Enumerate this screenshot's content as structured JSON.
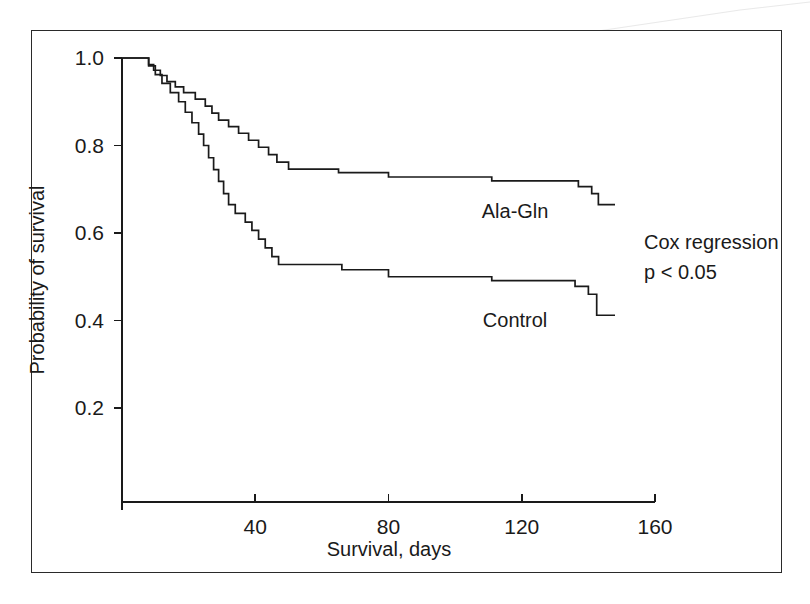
{
  "figure": {
    "border_color": "#2a2a2a",
    "background": "#ffffff",
    "line_color": "#1a1a1a"
  },
  "annotations": {
    "cox_line1": "Cox regression",
    "cox_line2": "p < 0.05"
  },
  "chart_data": {
    "type": "line",
    "subtype": "kaplan-meier-step",
    "title": "",
    "xlabel": "Survival, days",
    "ylabel": "Probability of survival",
    "xlim": [
      0,
      160
    ],
    "ylim": [
      0.0,
      1.0
    ],
    "xticks": [
      40,
      80,
      120,
      160
    ],
    "xtick_labels": [
      "40",
      "80",
      "120",
      "160"
    ],
    "yticks": [
      0.2,
      0.4,
      0.6,
      0.8,
      1.0
    ],
    "ytick_labels": [
      "0.2",
      "0.4",
      "0.6",
      "0.8",
      "1.0"
    ],
    "grid": false,
    "legend_position": "inline-annotation",
    "series": [
      {
        "name": "Ala-Gln",
        "label": "Ala-Gln",
        "label_x": 118,
        "label_y": 0.635,
        "color": "#1a1a1a",
        "points": [
          [
            0,
            1.0
          ],
          [
            8.0,
            1.0
          ],
          [
            8.0,
            0.985
          ],
          [
            9.5,
            0.985
          ],
          [
            9.5,
            0.972
          ],
          [
            11.5,
            0.972
          ],
          [
            11.5,
            0.96
          ],
          [
            13.5,
            0.96
          ],
          [
            13.5,
            0.946
          ],
          [
            16.0,
            0.946
          ],
          [
            16.0,
            0.934
          ],
          [
            18.5,
            0.934
          ],
          [
            18.5,
            0.921
          ],
          [
            22.0,
            0.921
          ],
          [
            22.0,
            0.906
          ],
          [
            25.0,
            0.906
          ],
          [
            25.0,
            0.89
          ],
          [
            27.0,
            0.89
          ],
          [
            27.0,
            0.874
          ],
          [
            29.0,
            0.874
          ],
          [
            29.0,
            0.858
          ],
          [
            32.0,
            0.858
          ],
          [
            32.0,
            0.843
          ],
          [
            35.0,
            0.843
          ],
          [
            35.0,
            0.828
          ],
          [
            38.0,
            0.828
          ],
          [
            38.0,
            0.812
          ],
          [
            41.0,
            0.812
          ],
          [
            41.0,
            0.796
          ],
          [
            44.0,
            0.796
          ],
          [
            44.0,
            0.779
          ],
          [
            46.5,
            0.779
          ],
          [
            46.5,
            0.762
          ],
          [
            50.0,
            0.762
          ],
          [
            50.0,
            0.746
          ],
          [
            65.0,
            0.746
          ],
          [
            65.0,
            0.738
          ],
          [
            80.0,
            0.738
          ],
          [
            80.0,
            0.728
          ],
          [
            111.0,
            0.728
          ],
          [
            111.0,
            0.719
          ],
          [
            137.0,
            0.719
          ],
          [
            137.0,
            0.706
          ],
          [
            141.0,
            0.706
          ],
          [
            141.0,
            0.69
          ],
          [
            143.0,
            0.69
          ],
          [
            143.0,
            0.665
          ],
          [
            148.0,
            0.665
          ]
        ]
      },
      {
        "name": "Control",
        "label": "Control",
        "label_x": 118,
        "label_y": 0.385,
        "color": "#1a1a1a",
        "points": [
          [
            0,
            1.0
          ],
          [
            8.0,
            1.0
          ],
          [
            8.0,
            0.982
          ],
          [
            10.0,
            0.982
          ],
          [
            10.0,
            0.962
          ],
          [
            12.0,
            0.962
          ],
          [
            12.0,
            0.942
          ],
          [
            14.5,
            0.942
          ],
          [
            14.5,
            0.921
          ],
          [
            17.0,
            0.921
          ],
          [
            17.0,
            0.9
          ],
          [
            19.0,
            0.9
          ],
          [
            19.0,
            0.876
          ],
          [
            21.0,
            0.876
          ],
          [
            21.0,
            0.852
          ],
          [
            23.0,
            0.852
          ],
          [
            23.0,
            0.826
          ],
          [
            24.5,
            0.826
          ],
          [
            24.5,
            0.8
          ],
          [
            26.0,
            0.8
          ],
          [
            26.0,
            0.772
          ],
          [
            27.5,
            0.772
          ],
          [
            27.5,
            0.745
          ],
          [
            29.0,
            0.745
          ],
          [
            29.0,
            0.718
          ],
          [
            30.5,
            0.718
          ],
          [
            30.5,
            0.69
          ],
          [
            32.0,
            0.69
          ],
          [
            32.0,
            0.665
          ],
          [
            34.0,
            0.665
          ],
          [
            34.0,
            0.645
          ],
          [
            37.0,
            0.645
          ],
          [
            37.0,
            0.625
          ],
          [
            39.0,
            0.625
          ],
          [
            39.0,
            0.606
          ],
          [
            41.0,
            0.606
          ],
          [
            41.0,
            0.586
          ],
          [
            43.0,
            0.586
          ],
          [
            43.0,
            0.566
          ],
          [
            45.0,
            0.566
          ],
          [
            45.0,
            0.546
          ],
          [
            47.0,
            0.546
          ],
          [
            47.0,
            0.528
          ],
          [
            66.0,
            0.528
          ],
          [
            66.0,
            0.516
          ],
          [
            80.0,
            0.516
          ],
          [
            80.0,
            0.5
          ],
          [
            111.0,
            0.5
          ],
          [
            111.0,
            0.491
          ],
          [
            136.0,
            0.491
          ],
          [
            136.0,
            0.478
          ],
          [
            140.0,
            0.478
          ],
          [
            140.0,
            0.46
          ],
          [
            142.5,
            0.46
          ],
          [
            142.5,
            0.412
          ],
          [
            148.0,
            0.412
          ]
        ]
      }
    ]
  }
}
